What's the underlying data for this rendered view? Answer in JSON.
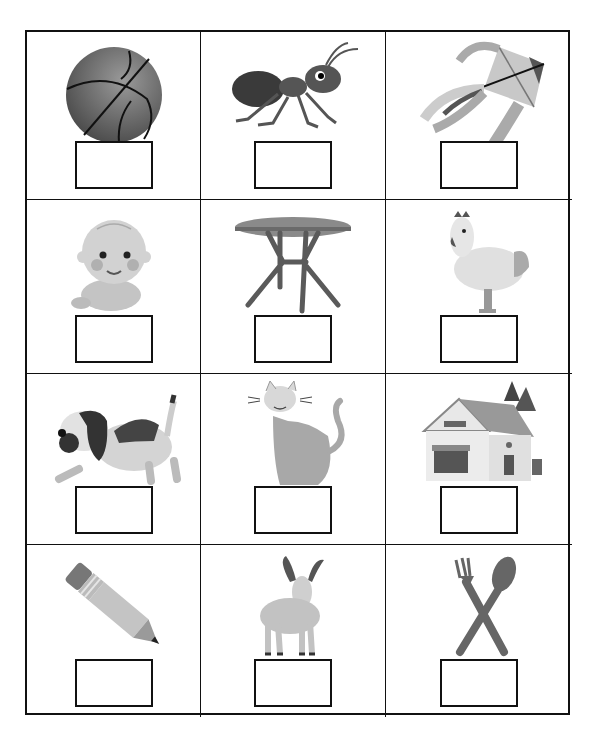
{
  "worksheet": {
    "type": "picture-label worksheet",
    "rows": 4,
    "columns": 3,
    "cells": [
      {
        "picture": "basketball",
        "answer": ""
      },
      {
        "picture": "ant",
        "answer": ""
      },
      {
        "picture": "kite",
        "answer": ""
      },
      {
        "picture": "baby",
        "answer": ""
      },
      {
        "picture": "table",
        "answer": ""
      },
      {
        "picture": "hen",
        "answer": ""
      },
      {
        "picture": "dog",
        "answer": ""
      },
      {
        "picture": "cat",
        "answer": ""
      },
      {
        "picture": "house",
        "answer": ""
      },
      {
        "picture": "pencil",
        "answer": ""
      },
      {
        "picture": "goat",
        "answer": ""
      },
      {
        "picture": "fork-and-spoon",
        "answer": ""
      }
    ]
  },
  "colors": {
    "grid_line": "#111111",
    "image_dark": "#4a4a4a",
    "image_mid": "#8c8c8c",
    "image_light": "#c8c8c8"
  }
}
